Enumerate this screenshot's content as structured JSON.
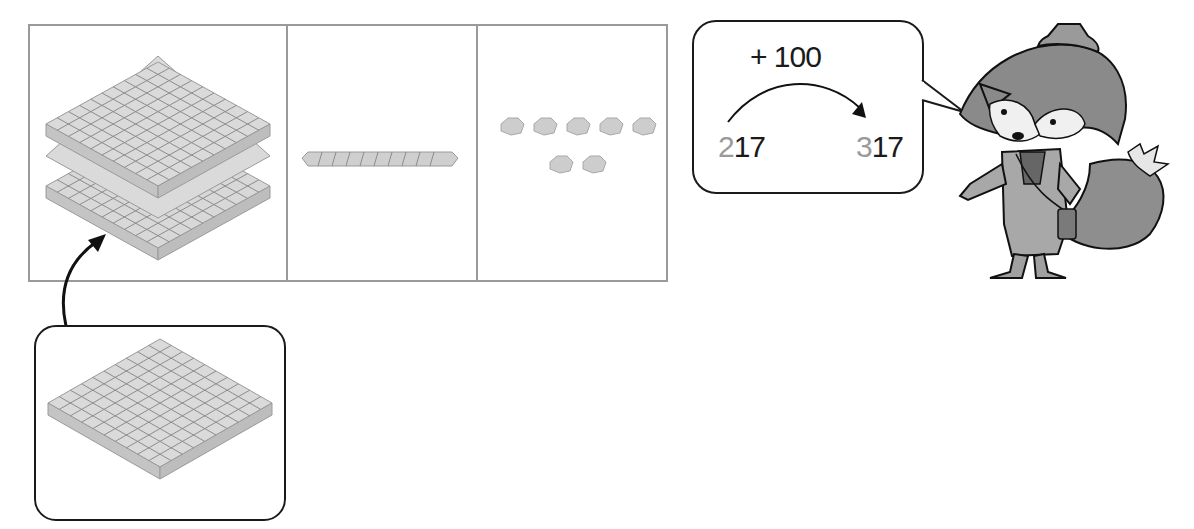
{
  "place_value_table": {
    "columns": [
      {
        "name": "hundreds",
        "blocks": "hundred-flat",
        "count": 2
      },
      {
        "name": "tens",
        "blocks": "ten-rod",
        "count": 1
      },
      {
        "name": "ones",
        "blocks": "unit-cube",
        "count": 7
      }
    ]
  },
  "added_block": {
    "type": "hundred-flat",
    "count": 1
  },
  "speech_bubble": {
    "operation": "+ 100",
    "start": {
      "changed_digit": "2",
      "rest": "17",
      "full": "217"
    },
    "end": {
      "changed_digit": "3",
      "rest": "17",
      "full": "317"
    }
  },
  "character": {
    "name": "fox-explorer"
  },
  "colors": {
    "block_fill": "#d6d6d6",
    "block_line": "#8c8c8c",
    "table_border": "#9a9a9a",
    "outline": "#1a1a1a",
    "highlight_digit": "#9a9a9a"
  }
}
